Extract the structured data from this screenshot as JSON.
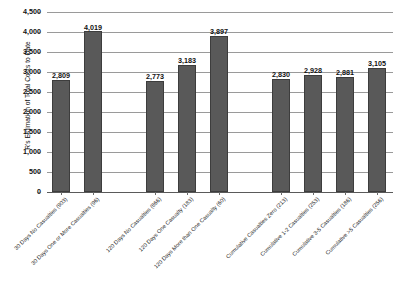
{
  "chart_data": {
    "type": "bar",
    "title": "",
    "subtitle": "",
    "xlabel": "",
    "ylabel": "R's Estimation of Total Costs to Date",
    "ylim": [
      0,
      4500
    ],
    "ytick_step": 500,
    "grid": true,
    "legend": false,
    "legend_position": "none",
    "bar_color": "#595959",
    "categories": [
      "30 Days No Casualties (903)",
      "30 Days One or More Casualties (96)",
      "120 Days No Casualties (866)",
      "120 Days One Casualty (183)",
      "120 Days More than One Casualty (60)",
      "Cumulative Casualties Zero (213)",
      "Cumulative 1-2 Casualties (253)",
      "Cumulative 3-5 Casualties (186)",
      "Cumulative >5 Casualties (256)"
    ],
    "values": [
      2809,
      4019,
      2773,
      3183,
      3897,
      2830,
      2928,
      2881,
      3105
    ],
    "value_labels": [
      "2,809",
      "4,019",
      "2,773",
      "3,183",
      "3,897",
      "2,830",
      "2,928",
      "2,881",
      "3,105"
    ],
    "ytick_labels": [
      "4,500",
      "4,000",
      "3,500",
      "3,000",
      "2,500",
      "2,000",
      "1,500",
      "1,000",
      "500",
      "0"
    ],
    "ytick_values": [
      4500,
      4000,
      3500,
      3000,
      2500,
      2000,
      1500,
      1000,
      500,
      0
    ],
    "groups": [
      {
        "name": "30 Days",
        "indices": [
          0,
          1
        ]
      },
      {
        "name": "120 Days",
        "indices": [
          2,
          3,
          4
        ]
      },
      {
        "name": "Cumulative",
        "indices": [
          5,
          6,
          7,
          8
        ]
      }
    ]
  }
}
